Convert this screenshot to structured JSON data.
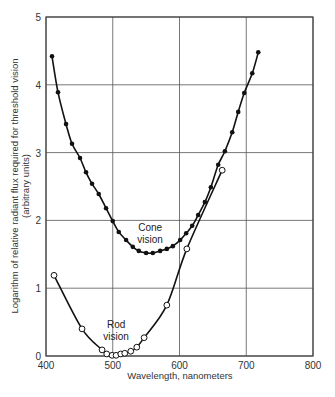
{
  "chart_data": {
    "type": "line",
    "title": "",
    "xlabel": "Wavelength, nanometers",
    "ylabel": "Logarithm of relative radiant flux required for threshold vision",
    "ylabel_sub": "(arbitrary units)",
    "xlim": [
      400,
      800
    ],
    "ylim": [
      0,
      5
    ],
    "xticks": [
      400,
      500,
      600,
      700,
      800
    ],
    "yticks": [
      0,
      1,
      2,
      3,
      4,
      5
    ],
    "xtick_labels": [
      "400",
      "500",
      "600",
      "700",
      "800"
    ],
    "ytick_labels": [
      "0",
      "1",
      "2",
      "3",
      "4",
      "5"
    ],
    "grid": true,
    "legend": "none (curves labeled inline)",
    "annotations": [
      {
        "text_lines": [
          "Cone",
          "vision"
        ],
        "x": 556,
        "y": 1.85
      },
      {
        "text_lines": [
          "Rod",
          "vision"
        ],
        "x": 505,
        "y": 0.42
      }
    ],
    "series": [
      {
        "name": "Cone vision",
        "marker": "filled-circle",
        "color": "#111111",
        "x": [
          409,
          418,
          430,
          439,
          451,
          460,
          469,
          479,
          490,
          500,
          509,
          520,
          530,
          539,
          550,
          560,
          571,
          581,
          590,
          601,
          610,
          619,
          628,
          638,
          647,
          658,
          668,
          679,
          688,
          697,
          709,
          718
        ],
        "y": [
          4.42,
          3.89,
          3.42,
          3.13,
          2.92,
          2.71,
          2.54,
          2.39,
          2.18,
          1.99,
          1.83,
          1.71,
          1.61,
          1.55,
          1.52,
          1.52,
          1.55,
          1.58,
          1.62,
          1.71,
          1.81,
          1.92,
          2.08,
          2.27,
          2.49,
          2.82,
          3.02,
          3.3,
          3.6,
          3.88,
          4.17,
          4.48
        ]
      },
      {
        "name": "Rod vision",
        "marker": "open-circle",
        "color": "#111111",
        "x": [
          412,
          454,
          484,
          491,
          499,
          505,
          512,
          518,
          527,
          536,
          547,
          581,
          611,
          664
        ],
        "y": [
          1.19,
          0.4,
          0.09,
          0.03,
          0.01,
          0.01,
          0.03,
          0.04,
          0.07,
          0.13,
          0.27,
          0.75,
          1.58,
          2.74
        ]
      }
    ]
  },
  "plot": {
    "left": 46,
    "right": 313,
    "top": 17,
    "bottom": 356,
    "grid_color": "#555555",
    "frame_color": "#444444"
  }
}
